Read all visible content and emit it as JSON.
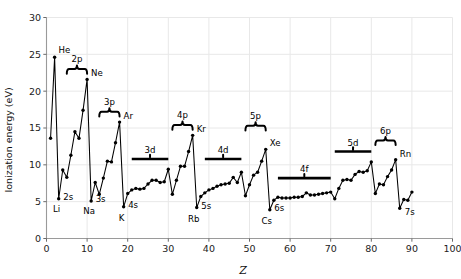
{
  "chart_data": {
    "type": "line",
    "title": "",
    "xlabel": "Z",
    "ylabel": "Ionization energy (eV)",
    "xlim": [
      0,
      100
    ],
    "ylim": [
      0,
      30
    ],
    "xticks": [
      0,
      10,
      20,
      30,
      40,
      50,
      60,
      70,
      80,
      90,
      100
    ],
    "yticks": [
      0,
      5,
      10,
      15,
      20,
      25,
      30
    ],
    "grid": true,
    "legend_position": "none",
    "marker": "filled-circle",
    "x": [
      1,
      2,
      3,
      4,
      5,
      6,
      7,
      8,
      9,
      10,
      11,
      12,
      13,
      14,
      15,
      16,
      17,
      18,
      19,
      20,
      21,
      22,
      23,
      24,
      25,
      26,
      27,
      28,
      29,
      30,
      31,
      32,
      33,
      34,
      35,
      36,
      37,
      38,
      39,
      40,
      41,
      42,
      43,
      44,
      45,
      46,
      47,
      48,
      49,
      50,
      51,
      52,
      53,
      54,
      55,
      56,
      57,
      58,
      59,
      60,
      61,
      62,
      63,
      64,
      65,
      66,
      67,
      68,
      69,
      70,
      71,
      72,
      73,
      74,
      75,
      76,
      77,
      78,
      79,
      80,
      81,
      82,
      83,
      84,
      85,
      86,
      87,
      88,
      89,
      90
    ],
    "y": [
      13.6,
      24.6,
      5.4,
      9.3,
      8.3,
      11.3,
      14.5,
      13.6,
      17.4,
      21.6,
      5.1,
      7.6,
      6.0,
      8.2,
      10.5,
      10.4,
      13.0,
      15.8,
      4.3,
      6.1,
      6.6,
      6.8,
      6.7,
      6.8,
      7.4,
      7.9,
      7.9,
      7.6,
      7.7,
      9.4,
      6.0,
      7.9,
      9.8,
      9.8,
      11.8,
      14.0,
      4.2,
      5.7,
      6.2,
      6.6,
      6.8,
      7.1,
      7.3,
      7.4,
      7.5,
      8.3,
      7.6,
      9.0,
      5.8,
      7.3,
      8.6,
      9.0,
      10.5,
      12.1,
      3.9,
      5.2,
      5.6,
      5.5,
      5.5,
      5.5,
      5.6,
      5.6,
      5.7,
      6.2,
      5.9,
      5.9,
      6.0,
      6.1,
      6.2,
      6.3,
      5.4,
      6.8,
      7.9,
      8.0,
      7.9,
      8.7,
      9.1,
      9.0,
      9.2,
      10.4,
      6.1,
      7.4,
      7.3,
      8.4,
      9.3,
      10.7,
      4.1,
      5.3,
      5.2,
      6.3
    ],
    "element_labels": [
      {
        "symbol": "He",
        "Z": 2,
        "energy": 24.6
      },
      {
        "symbol": "Li",
        "Z": 3,
        "energy": 5.4
      },
      {
        "symbol": "Ne",
        "Z": 10,
        "energy": 21.6
      },
      {
        "symbol": "Na",
        "Z": 11,
        "energy": 5.1
      },
      {
        "symbol": "Ar",
        "Z": 18,
        "energy": 15.8
      },
      {
        "symbol": "K",
        "Z": 19,
        "energy": 4.3
      },
      {
        "symbol": "Kr",
        "Z": 36,
        "energy": 14.0
      },
      {
        "symbol": "Rb",
        "Z": 37,
        "energy": 4.2
      },
      {
        "symbol": "Xe",
        "Z": 54,
        "energy": 12.1
      },
      {
        "symbol": "Cs",
        "Z": 55,
        "energy": 3.9
      },
      {
        "symbol": "Rn",
        "Z": 86,
        "energy": 10.7
      },
      {
        "symbol": "7s",
        "Z": 87,
        "energy": 4.1
      }
    ],
    "subshell_annotations": [
      {
        "label": "2s",
        "style": "text",
        "Z": 3,
        "energy": 5.4
      },
      {
        "label": "2p",
        "style": "brace",
        "z_start": 5,
        "z_end": 10,
        "energy": 23.0
      },
      {
        "label": "3s",
        "style": "text",
        "Z": 11,
        "energy": 5.1
      },
      {
        "label": "3p",
        "style": "brace",
        "z_start": 13,
        "z_end": 18,
        "energy": 17.2
      },
      {
        "label": "4s",
        "style": "text",
        "Z": 19,
        "energy": 4.3
      },
      {
        "label": "3d",
        "style": "flatbar",
        "z_start": 21,
        "z_end": 30,
        "energy": 10.8
      },
      {
        "label": "4p",
        "style": "brace",
        "z_start": 31,
        "z_end": 36,
        "energy": 15.4
      },
      {
        "label": "5s",
        "style": "text",
        "Z": 37,
        "energy": 4.2
      },
      {
        "label": "4d",
        "style": "flatbar",
        "z_start": 39,
        "z_end": 48,
        "energy": 10.8
      },
      {
        "label": "5p",
        "style": "brace",
        "z_start": 49,
        "z_end": 54,
        "energy": 15.3
      },
      {
        "label": "6s",
        "style": "text",
        "Z": 55,
        "energy": 3.9
      },
      {
        "label": "4f",
        "style": "flatbar",
        "z_start": 57,
        "z_end": 70,
        "energy": 8.2
      },
      {
        "label": "5d",
        "style": "flatbar",
        "z_start": 71,
        "z_end": 80,
        "energy": 11.8
      },
      {
        "label": "6p",
        "style": "brace",
        "z_start": 81,
        "z_end": 86,
        "energy": 13.3
      }
    ],
    "colors": {
      "line": "#000000",
      "marker": "#000000",
      "grid": "#e8e8e8",
      "spine": "#9a9a9a",
      "background": "#ffffff"
    }
  }
}
